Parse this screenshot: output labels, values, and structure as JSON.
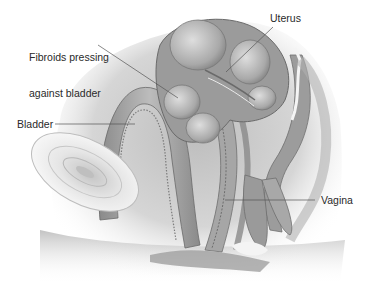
{
  "figure": {
    "type": "anatomical-illustration",
    "style": "grayscale sagittal cross-section of female pelvis",
    "background_color": "#ffffff",
    "tone_colors": {
      "dark": "#6e6e6e",
      "mid": "#9a9a9a",
      "light": "#cfcfcf",
      "highlight": "#f2f2f2",
      "leader_line": "#555555"
    }
  },
  "labels": {
    "fibroids": {
      "line1": "Fibroids pressing",
      "line2": "against bladder"
    },
    "uterus": "Uterus",
    "bladder": "Bladder",
    "vagina": "Vagina"
  }
}
